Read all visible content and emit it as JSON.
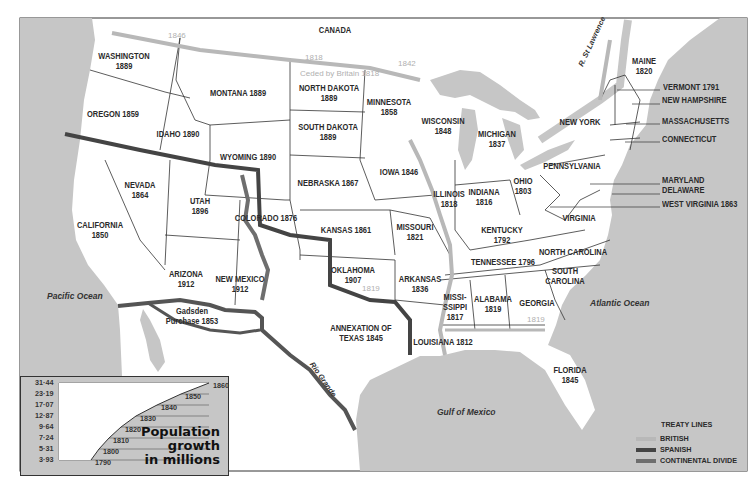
{
  "map": {
    "colors": {
      "sea": "#c6c6c6",
      "land": "#ffffff",
      "british": "#b8b8b8",
      "spanish": "#444444",
      "divide": "#6e6e6e",
      "border": "#333333"
    },
    "regions": [
      {
        "id": "canada",
        "label": "CANADA",
        "x": 335,
        "y": 30
      },
      {
        "id": "washington",
        "label": "WASHINGTON\n1889",
        "x": 124,
        "y": 61
      },
      {
        "id": "oregon",
        "label": "OREGON 1859",
        "x": 113,
        "y": 114
      },
      {
        "id": "montana",
        "label": "MONTANA 1889",
        "x": 238,
        "y": 93
      },
      {
        "id": "idaho",
        "label": "IDAHO 1890",
        "x": 178,
        "y": 134
      },
      {
        "id": "north-dakota",
        "label": "NORTH DAKOTA\n1889",
        "x": 329,
        "y": 93
      },
      {
        "id": "south-dakota",
        "label": "SOUTH DAKOTA\n1889",
        "x": 328,
        "y": 132
      },
      {
        "id": "minnesota",
        "label": "MINNESOTA\n1858",
        "x": 389,
        "y": 107
      },
      {
        "id": "wisconsin",
        "label": "WISCONSIN\n1848",
        "x": 443,
        "y": 126
      },
      {
        "id": "michigan",
        "label": "MICHIGAN\n1837",
        "x": 497,
        "y": 139
      },
      {
        "id": "wyoming",
        "label": "WYOMING 1890",
        "x": 248,
        "y": 157
      },
      {
        "id": "nebraska",
        "label": "NEBRASKA 1867",
        "x": 328,
        "y": 183
      },
      {
        "id": "iowa",
        "label": "IOWA 1846",
        "x": 399,
        "y": 172
      },
      {
        "id": "illinois",
        "label": "ILLINOIS\n1818",
        "x": 449,
        "y": 199
      },
      {
        "id": "indiana",
        "label": "INDIANA\n1816",
        "x": 484,
        "y": 197
      },
      {
        "id": "ohio",
        "label": "OHIO\n1803",
        "x": 523,
        "y": 186
      },
      {
        "id": "pennsylvania",
        "label": "PENNSYLVANIA",
        "x": 572,
        "y": 166
      },
      {
        "id": "new-york",
        "label": "NEW YORK",
        "x": 580,
        "y": 122
      },
      {
        "id": "maine",
        "label": "MAINE\n1820",
        "x": 644,
        "y": 66
      },
      {
        "id": "nevada",
        "label": "NEVADA\n1864",
        "x": 140,
        "y": 190
      },
      {
        "id": "utah",
        "label": "UTAH\n1896",
        "x": 200,
        "y": 206
      },
      {
        "id": "colorado",
        "label": "COLORADO 1876",
        "x": 266,
        "y": 218
      },
      {
        "id": "kansas",
        "label": "KANSAS 1861",
        "x": 346,
        "y": 230
      },
      {
        "id": "missouri",
        "label": "MISSOURI\n1821",
        "x": 415,
        "y": 232
      },
      {
        "id": "kentucky",
        "label": "KENTUCKY\n1792",
        "x": 502,
        "y": 235
      },
      {
        "id": "virginia",
        "label": "VIRGINIA",
        "x": 579,
        "y": 218
      },
      {
        "id": "california",
        "label": "CALIFORNIA\n1850",
        "x": 100,
        "y": 230
      },
      {
        "id": "north-carolina",
        "label": "NORTH CAROLINA",
        "x": 573,
        "y": 252
      },
      {
        "id": "tennessee",
        "label": "TENNESSEE 1796",
        "x": 503,
        "y": 262
      },
      {
        "id": "oklahoma",
        "label": "OKLAHOMA\n1907",
        "x": 353,
        "y": 275
      },
      {
        "id": "arkansas",
        "label": "ARKANSAS\n1836",
        "x": 420,
        "y": 284
      },
      {
        "id": "arizona",
        "label": "ARIZONA\n1912",
        "x": 186,
        "y": 279
      },
      {
        "id": "new-mexico",
        "label": "NEW MEXICO\n1912",
        "x": 240,
        "y": 284
      },
      {
        "id": "south-carolina",
        "label": "SOUTH\nCAROLINA",
        "x": 565,
        "y": 276
      },
      {
        "id": "mississippi",
        "label": "MISSI-\nSSIPPI\n1817",
        "x": 455,
        "y": 307
      },
      {
        "id": "alabama",
        "label": "ALABAMA\n1819",
        "x": 493,
        "y": 304
      },
      {
        "id": "georgia",
        "label": "GEORGIA",
        "x": 537,
        "y": 303
      },
      {
        "id": "gadsden",
        "label": "Gadsden\nPurchase 1853",
        "x": 192,
        "y": 316
      },
      {
        "id": "texas",
        "label": "ANNEXATION OF\nTEXAS 1845",
        "x": 361,
        "y": 333
      },
      {
        "id": "louisiana",
        "label": "LOUISIANA 1812",
        "x": 443,
        "y": 342
      },
      {
        "id": "florida",
        "label": "FLORIDA\n1845",
        "x": 570,
        "y": 375
      }
    ],
    "oceans": [
      {
        "id": "pacific",
        "label": "Pacific Ocean",
        "x": 47,
        "y": 296
      },
      {
        "id": "atlantic",
        "label": "Atlantic Ocean",
        "x": 590,
        "y": 303
      },
      {
        "id": "gulf",
        "label": "Gulf of Mexico",
        "x": 437,
        "y": 412
      }
    ],
    "treaty_labels": [
      {
        "label": "1846",
        "x": 168,
        "y": 36
      },
      {
        "label": "1818",
        "x": 305,
        "y": 58
      },
      {
        "label": "Ceded by Britain 1818",
        "x": 300,
        "y": 74
      },
      {
        "label": "1842",
        "x": 398,
        "y": 64
      },
      {
        "label": "1819",
        "x": 362,
        "y": 289
      },
      {
        "label": "1819",
        "x": 527,
        "y": 320
      }
    ],
    "river_labels": [
      {
        "label": "R. St Lawrence",
        "x": 590,
        "y": 42
      },
      {
        "label": "Rio Grande",
        "x": 328,
        "y": 380
      }
    ],
    "callouts": [
      {
        "label": "VERMONT 1791",
        "x": 663,
        "y": 87
      },
      {
        "label": "NEW HAMPSHIRE",
        "x": 662,
        "y": 100
      },
      {
        "label": "MASSACHUSETTS",
        "x": 662,
        "y": 121
      },
      {
        "label": "CONNECTICUT",
        "x": 662,
        "y": 139
      },
      {
        "label": "MARYLAND",
        "x": 662,
        "y": 180
      },
      {
        "label": "DELAWARE",
        "x": 662,
        "y": 190
      },
      {
        "label": "WEST VIRGINIA 1863",
        "x": 662,
        "y": 204
      }
    ]
  },
  "inset": {
    "title_lines": [
      "Population",
      "growth",
      "in millions"
    ],
    "y_ticks": [
      "31·44",
      "23·19",
      "17·07",
      "12·87",
      "9·64",
      "7·24",
      "5·31",
      "3·93"
    ],
    "x_labels": [
      "1790",
      "1800",
      "1810",
      "1820",
      "1830",
      "1840",
      "1850",
      "1860"
    ]
  },
  "legend": {
    "title": "TREATY LINES",
    "items": [
      {
        "label": "BRITISH",
        "color": "#b8b8b8"
      },
      {
        "label": "SPANISH",
        "color": "#444444"
      },
      {
        "label": "CONTINENTAL DIVIDE",
        "color": "#6e6e6e"
      }
    ]
  },
  "chart_data": {
    "type": "line",
    "title": "Population growth in millions",
    "x": [
      1790,
      1800,
      1810,
      1820,
      1830,
      1840,
      1850,
      1860
    ],
    "values": [
      3.93,
      5.31,
      7.24,
      9.64,
      12.87,
      17.07,
      23.19,
      31.44
    ],
    "xlabel": "",
    "ylabel": "millions",
    "grid": true
  }
}
